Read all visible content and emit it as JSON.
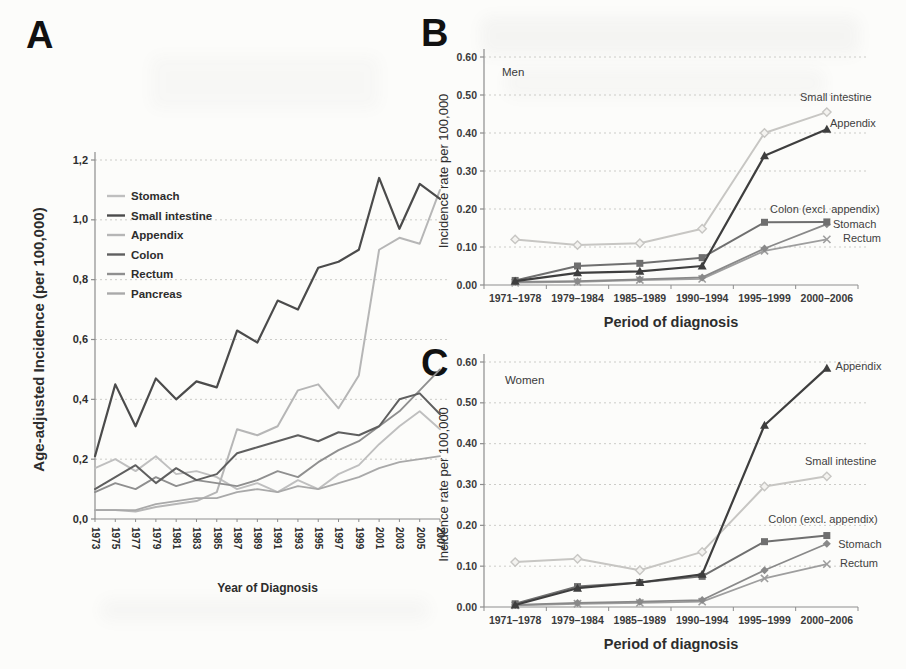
{
  "figure": {
    "background": "#fcfcfa",
    "text_color": "#2d2d2d"
  },
  "chart_data": [
    {
      "panel_letter": "A",
      "type": "line",
      "title": "",
      "xlabel": "Year of Diagnosis",
      "ylabel": "Age-adjusted Incidence (per 100,000)",
      "ylim": [
        0,
        1.2
      ],
      "grid": "dotted-horizontal",
      "y_ticks": [
        {
          "v": 0.0,
          "label": "0,0"
        },
        {
          "v": 0.2,
          "label": "0,2"
        },
        {
          "v": 0.4,
          "label": "0,4"
        },
        {
          "v": 0.6,
          "label": "0,6"
        },
        {
          "v": 0.8,
          "label": "0,8"
        },
        {
          "v": 1.0,
          "label": "1,0"
        },
        {
          "v": 1.2,
          "label": "1,2"
        }
      ],
      "x": [
        "1973",
        "1975",
        "1977",
        "1979",
        "1981",
        "1983",
        "1985",
        "1987",
        "1989",
        "1991",
        "1993",
        "1995",
        "1997",
        "1999",
        "2001",
        "2003",
        "2005",
        "2007"
      ],
      "legend": [
        {
          "label": "Stomach",
          "color": "#bfbfbf"
        },
        {
          "label": "Small intestine",
          "color": "#4b4b4b"
        },
        {
          "label": "Appendix",
          "color": "#b6b6b6"
        },
        {
          "label": "Colon",
          "color": "#5f5f5f"
        },
        {
          "label": "Rectum",
          "color": "#8f8f8f"
        },
        {
          "label": "Pancreas",
          "color": "#a9a9a9"
        }
      ],
      "series": [
        {
          "name": "Stomach",
          "color": "#bfbfbf",
          "width": 1.9,
          "marker": null,
          "values": [
            0.17,
            0.2,
            0.16,
            0.21,
            0.15,
            0.16,
            0.14,
            0.1,
            0.12,
            0.09,
            0.13,
            0.1,
            0.15,
            0.18,
            0.25,
            0.31,
            0.36,
            0.3
          ]
        },
        {
          "name": "Appendix",
          "color": "#b6b6b6",
          "width": 2.0,
          "marker": null,
          "values": [
            0.03,
            0.03,
            0.025,
            0.04,
            0.05,
            0.06,
            0.09,
            0.3,
            0.28,
            0.31,
            0.43,
            0.45,
            0.37,
            0.48,
            0.9,
            0.94,
            0.92,
            1.1
          ]
        },
        {
          "name": "Pancreas",
          "color": "#a9a9a9",
          "width": 1.8,
          "marker": null,
          "values": [
            0.03,
            0.03,
            0.03,
            0.05,
            0.06,
            0.07,
            0.07,
            0.09,
            0.1,
            0.09,
            0.11,
            0.1,
            0.12,
            0.14,
            0.17,
            0.19,
            0.2,
            0.21
          ]
        },
        {
          "name": "Rectum",
          "color": "#8f8f8f",
          "width": 1.9,
          "marker": null,
          "values": [
            0.09,
            0.12,
            0.1,
            0.14,
            0.11,
            0.13,
            0.12,
            0.11,
            0.13,
            0.16,
            0.14,
            0.19,
            0.23,
            0.26,
            0.31,
            0.36,
            0.43,
            0.5
          ]
        },
        {
          "name": "Colon",
          "color": "#5f5f5f",
          "width": 2.0,
          "marker": null,
          "values": [
            0.1,
            0.14,
            0.18,
            0.12,
            0.17,
            0.13,
            0.15,
            0.22,
            0.24,
            0.26,
            0.28,
            0.26,
            0.29,
            0.28,
            0.31,
            0.4,
            0.42,
            0.35
          ]
        },
        {
          "name": "Small intestine",
          "color": "#4b4b4b",
          "width": 2.2,
          "marker": null,
          "values": [
            0.21,
            0.45,
            0.31,
            0.47,
            0.4,
            0.46,
            0.44,
            0.63,
            0.59,
            0.73,
            0.7,
            0.84,
            0.86,
            0.9,
            1.14,
            0.97,
            1.12,
            1.07
          ]
        }
      ]
    },
    {
      "panel_letter": "B",
      "type": "line",
      "title": "",
      "inner_label": {
        "text": "Men",
        "fx": 0.048,
        "v": 0.55
      },
      "xlabel": "Period of diagnosis",
      "ylabel": "Incidence rate per 100,000",
      "ylim": [
        0,
        0.6
      ],
      "grid": "dotted-horizontal",
      "y_ticks": [
        {
          "v": 0.0,
          "label": "0.00"
        },
        {
          "v": 0.1,
          "label": "0.10"
        },
        {
          "v": 0.2,
          "label": "0.20"
        },
        {
          "v": 0.3,
          "label": "0.30"
        },
        {
          "v": 0.4,
          "label": "0.40"
        },
        {
          "v": 0.5,
          "label": "0.50"
        },
        {
          "v": 0.6,
          "label": "0.60"
        }
      ],
      "x": [
        "1971–1978",
        "1979–1984",
        "1985–1989",
        "1990–1994",
        "1995–1999",
        "2000–2006"
      ],
      "series": [
        {
          "name": "Small intestine",
          "color": "#c7c6c3",
          "width": 2.0,
          "marker": "diamond-open",
          "values": [
            0.12,
            0.105,
            0.11,
            0.148,
            0.4,
            0.455
          ]
        },
        {
          "name": "Rectum",
          "color": "#9e9e9e",
          "width": 1.8,
          "marker": "x",
          "values": [
            0.006,
            0.008,
            0.013,
            0.016,
            0.09,
            0.12
          ]
        },
        {
          "name": "Stomach",
          "color": "#898989",
          "width": 1.8,
          "marker": "diamond",
          "values": [
            0.008,
            0.01,
            0.015,
            0.02,
            0.096,
            0.16
          ]
        },
        {
          "name": "Colon (excl. appendix)",
          "color": "#6f6f6f",
          "width": 2.0,
          "marker": "square",
          "values": [
            0.012,
            0.05,
            0.057,
            0.072,
            0.165,
            0.166
          ]
        },
        {
          "name": "Appendix",
          "color": "#3e3e3e",
          "width": 2.2,
          "marker": "triangle",
          "values": [
            0.01,
            0.032,
            0.036,
            0.05,
            0.34,
            0.41
          ]
        }
      ],
      "annotations": [
        {
          "text": "Small intestine",
          "fx": 0.845,
          "v": 0.485
        },
        {
          "text": "Appendix",
          "fx": 0.925,
          "v": 0.417
        },
        {
          "text": "Colon (excl. appendix)",
          "fx": 0.765,
          "v": 0.19
        },
        {
          "text": "Stomach",
          "fx": 0.933,
          "v": 0.15
        },
        {
          "text": "Rectum",
          "fx": 0.96,
          "v": 0.113
        }
      ]
    },
    {
      "panel_letter": "C",
      "type": "line",
      "title": "",
      "inner_label": {
        "text": "Women",
        "fx": 0.056,
        "v": 0.545
      },
      "xlabel": "Period of diagnosis",
      "ylabel": "Incidence rate per 100,000",
      "ylim": [
        0,
        0.6
      ],
      "grid": "dotted-horizontal",
      "y_ticks": [
        {
          "v": 0.0,
          "label": "0.00"
        },
        {
          "v": 0.1,
          "label": "0.10"
        },
        {
          "v": 0.2,
          "label": "0.20"
        },
        {
          "v": 0.3,
          "label": "0.30"
        },
        {
          "v": 0.4,
          "label": "0.40"
        },
        {
          "v": 0.5,
          "label": "0.50"
        },
        {
          "v": 0.6,
          "label": "0.60"
        }
      ],
      "x": [
        "1971–1978",
        "1979–1984",
        "1985–1989",
        "1990–1994",
        "1995–1999",
        "2000–2006"
      ],
      "series": [
        {
          "name": "Small intestine",
          "color": "#c7c6c3",
          "width": 2.0,
          "marker": "diamond-open",
          "values": [
            0.11,
            0.118,
            0.09,
            0.135,
            0.295,
            0.32
          ]
        },
        {
          "name": "Rectum",
          "color": "#9e9e9e",
          "width": 1.8,
          "marker": "x",
          "values": [
            0.004,
            0.008,
            0.01,
            0.013,
            0.07,
            0.105
          ]
        },
        {
          "name": "Stomach",
          "color": "#898989",
          "width": 1.8,
          "marker": "diamond",
          "values": [
            0.005,
            0.01,
            0.013,
            0.017,
            0.09,
            0.155
          ]
        },
        {
          "name": "Colon (excl. appendix)",
          "color": "#6f6f6f",
          "width": 2.0,
          "marker": "square",
          "values": [
            0.008,
            0.05,
            0.06,
            0.075,
            0.16,
            0.175
          ]
        },
        {
          "name": "Appendix",
          "color": "#3e3e3e",
          "width": 2.2,
          "marker": "triangle",
          "values": [
            0.005,
            0.046,
            0.06,
            0.08,
            0.445,
            0.585
          ]
        }
      ],
      "annotations": [
        {
          "text": "Appendix",
          "fx": 0.94,
          "v": 0.58
        },
        {
          "text": "Small intestine",
          "fx": 0.858,
          "v": 0.348
        },
        {
          "text": "Colon (excl. appendix)",
          "fx": 0.76,
          "v": 0.206
        },
        {
          "text": "Stomach",
          "fx": 0.947,
          "v": 0.145
        },
        {
          "text": "Rectum",
          "fx": 0.952,
          "v": 0.098
        }
      ]
    }
  ]
}
